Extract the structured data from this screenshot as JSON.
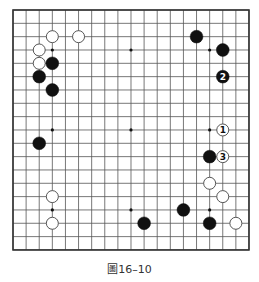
{
  "board": {
    "size": 19,
    "origin_x": 13,
    "origin_y": 10,
    "spacing_x": 13.11,
    "spacing_y": 13.33,
    "line_color": "#555555",
    "border_color": "#333333",
    "star_points": [
      [
        3,
        3
      ],
      [
        9,
        3
      ],
      [
        15,
        3
      ],
      [
        3,
        9
      ],
      [
        9,
        9
      ],
      [
        15,
        9
      ],
      [
        3,
        15
      ],
      [
        9,
        15
      ],
      [
        15,
        15
      ]
    ],
    "stones": [
      {
        "color": "white",
        "col": 3,
        "row": 2
      },
      {
        "color": "white",
        "col": 5,
        "row": 2
      },
      {
        "color": "white",
        "col": 2,
        "row": 3
      },
      {
        "color": "white",
        "col": 2,
        "row": 4
      },
      {
        "color": "black",
        "col": 3,
        "row": 4
      },
      {
        "color": "black",
        "col": 2,
        "row": 5
      },
      {
        "color": "black",
        "col": 3,
        "row": 6
      },
      {
        "color": "black",
        "col": 2,
        "row": 10
      },
      {
        "color": "white",
        "col": 3,
        "row": 14
      },
      {
        "color": "white",
        "col": 3,
        "row": 16
      },
      {
        "color": "black",
        "col": 14,
        "row": 2
      },
      {
        "color": "black",
        "col": 16,
        "row": 3
      },
      {
        "color": "black",
        "col": 16,
        "row": 5,
        "label": "2"
      },
      {
        "color": "white",
        "col": 16,
        "row": 9,
        "label": "1"
      },
      {
        "color": "black",
        "col": 15,
        "row": 11
      },
      {
        "color": "white",
        "col": 16,
        "row": 11,
        "label": "3"
      },
      {
        "color": "white",
        "col": 15,
        "row": 13
      },
      {
        "color": "white",
        "col": 16,
        "row": 14
      },
      {
        "color": "black",
        "col": 13,
        "row": 15
      },
      {
        "color": "black",
        "col": 10,
        "row": 16
      },
      {
        "color": "black",
        "col": 15,
        "row": 16
      },
      {
        "color": "white",
        "col": 17,
        "row": 16
      }
    ]
  },
  "caption": "圖16–10"
}
